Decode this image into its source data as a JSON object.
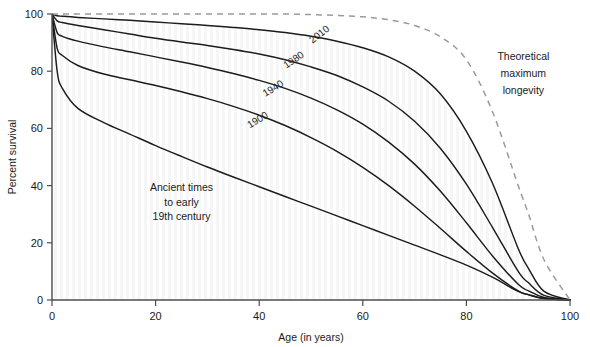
{
  "chart_data": {
    "type": "area",
    "title": "",
    "xlabel": "Age (in years)",
    "ylabel": "Percent survival",
    "xlim": [
      0,
      100
    ],
    "ylim": [
      0,
      100
    ],
    "xticks": [
      0,
      20,
      40,
      60,
      80,
      100
    ],
    "yticks": [
      0,
      20,
      40,
      60,
      80,
      100
    ],
    "grid": false,
    "legend_position": "inline-curve-labels",
    "x": [
      0,
      1,
      2,
      5,
      10,
      15,
      20,
      25,
      30,
      35,
      40,
      45,
      50,
      55,
      60,
      65,
      70,
      75,
      80,
      85,
      90,
      92,
      95,
      100
    ],
    "series": [
      {
        "name": "Theoretical maximum longevity",
        "style": "dashed",
        "values": [
          100,
          100,
          100,
          100,
          100,
          100,
          100,
          100,
          100,
          100,
          100,
          100,
          99.8,
          99.5,
          99,
          98,
          96,
          92,
          84,
          66,
          40,
          30,
          14,
          0
        ]
      },
      {
        "name": "2010",
        "style": "solid",
        "values": [
          100,
          99.4,
          99.2,
          98.8,
          98.3,
          97.8,
          97.2,
          96.6,
          96.0,
          95.3,
          94.5,
          93.5,
          92.2,
          90.5,
          88.2,
          85.0,
          80.0,
          72.0,
          59.0,
          41.0,
          18.0,
          11.0,
          3.0,
          0
        ]
      },
      {
        "name": "1980",
        "style": "solid",
        "values": [
          100,
          97.6,
          97.0,
          96.0,
          94.5,
          93.0,
          91.5,
          90.2,
          89.0,
          87.6,
          86.0,
          84.0,
          81.5,
          78.5,
          74.5,
          69.5,
          62.5,
          53.0,
          40.5,
          25.5,
          10.0,
          6.0,
          1.6,
          0
        ]
      },
      {
        "name": "1940",
        "style": "solid",
        "values": [
          100,
          93.5,
          92.2,
          90.5,
          88.5,
          86.8,
          85.0,
          83.2,
          81.3,
          79.2,
          76.8,
          74.0,
          70.6,
          66.5,
          61.5,
          55.2,
          47.5,
          38.0,
          27.0,
          15.5,
          5.5,
          3.2,
          0.9,
          0
        ]
      },
      {
        "name": "1900",
        "style": "solid",
        "values": [
          100,
          88.0,
          85.5,
          82.0,
          79.0,
          77.0,
          75.0,
          72.8,
          70.4,
          67.7,
          64.6,
          61.0,
          56.8,
          52.0,
          46.4,
          40.0,
          32.8,
          25.0,
          17.0,
          9.5,
          3.2,
          1.9,
          0.5,
          0
        ]
      },
      {
        "name": "Ancient times to early 19th century",
        "style": "solid",
        "values": [
          100,
          80.0,
          74.0,
          67.0,
          62.0,
          58.0,
          54.0,
          50.2,
          46.5,
          43.0,
          39.6,
          36.2,
          32.8,
          29.4,
          26.0,
          22.6,
          19.2,
          15.8,
          12.2,
          8.0,
          3.0,
          1.8,
          0.5,
          0
        ]
      }
    ],
    "annotations": [
      {
        "text": "2010",
        "x": 52,
        "y": 92,
        "rotation": -38
      },
      {
        "text": "1980",
        "x": 47,
        "y": 83,
        "rotation": -34
      },
      {
        "text": "1940",
        "x": 43,
        "y": 73,
        "rotation": -32
      },
      {
        "text": "1900",
        "x": 40,
        "y": 62,
        "rotation": -31
      },
      {
        "text": "Theoretical",
        "x": 91,
        "y": 84,
        "rotation": 0
      },
      {
        "text": "maximum",
        "x": 91,
        "y": 78,
        "rotation": 0
      },
      {
        "text": "longevity",
        "x": 91,
        "y": 72,
        "rotation": 0
      },
      {
        "text": "Ancient times",
        "x": 25,
        "y": 38,
        "rotation": 0
      },
      {
        "text": "to early",
        "x": 25,
        "y": 33,
        "rotation": 0
      },
      {
        "text": "19th century",
        "x": 25,
        "y": 28,
        "rotation": 0
      }
    ],
    "band_colors": {
      "band_2010": "#b3b3b3",
      "band_1980": "#ececec",
      "band_1940": "#9a9a9a",
      "band_1900": "#bdbdbd",
      "band_ancient": "#cccccc",
      "curve_stroke": "#1c1c1c",
      "theoretical_stroke": "#9a9a9a",
      "axis": "#4d4d4d",
      "background": "#ffffff"
    }
  },
  "axes": {
    "x_label": "Age (in years)",
    "y_label": "Percent survival",
    "x_ticks": [
      "0",
      "20",
      "40",
      "60",
      "80",
      "100"
    ],
    "y_ticks": [
      "0",
      "20",
      "40",
      "60",
      "80",
      "100"
    ]
  },
  "curve_labels": {
    "c2010": "2010",
    "c1980": "1980",
    "c1940": "1940",
    "c1900": "1900"
  },
  "notes": {
    "theoretical_l1": "Theoretical",
    "theoretical_l2": "maximum",
    "theoretical_l3": "longevity",
    "ancient_l1": "Ancient times",
    "ancient_l2": "to early",
    "ancient_l3": "19th century"
  }
}
